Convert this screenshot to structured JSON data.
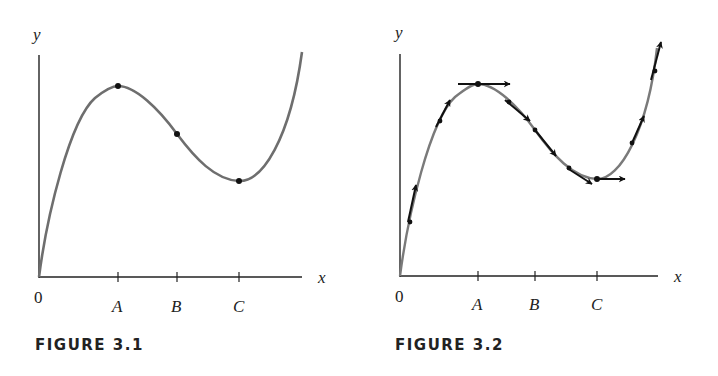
{
  "figures": [
    {
      "caption": "FIGURE 3.1",
      "axis_labels": {
        "x": "x",
        "y": "y",
        "origin": "0"
      },
      "tick_labels": [
        "A",
        "B",
        "C"
      ]
    },
    {
      "caption": "FIGURE 3.2",
      "axis_labels": {
        "x": "x",
        "y": "y",
        "origin": "0"
      },
      "tick_labels": [
        "A",
        "B",
        "C"
      ]
    }
  ],
  "colors": {
    "curve": "#6e6e6e",
    "axis": "#222222",
    "arrow": "#111111",
    "points": "#111111"
  }
}
